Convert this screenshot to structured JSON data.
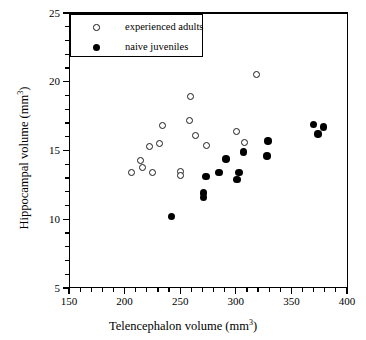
{
  "chart_data": {
    "type": "scatter",
    "title": "",
    "xlabel": "Telencephalon volume (mm3)",
    "ylabel": "Hippocampal volume (mm3)",
    "xlabel_text": "Telencephalon volume (mm",
    "xlabel_sup": "3",
    "xlabel_tail": ")",
    "ylabel_text": "Hippocampal volume (mm",
    "ylabel_sup": "3",
    "ylabel_tail": ")",
    "xlim": [
      150,
      400
    ],
    "ylim": [
      5,
      25
    ],
    "xticks": [
      150,
      200,
      250,
      300,
      350,
      400
    ],
    "xtick_labels": [
      "150",
      "200",
      "250",
      "300",
      "350",
      "400"
    ],
    "yticks": [
      5,
      10,
      15,
      20,
      25
    ],
    "ytick_labels": [
      "5",
      "10",
      "15",
      "20",
      "25"
    ],
    "x_minor_interval": 10,
    "y_minor_interval": 1,
    "grid": false,
    "legend_position": "top-left",
    "series": [
      {
        "name": "experienced adults",
        "marker": "open-circle",
        "color": "#ffffff",
        "edge_color": "#1a1a1a",
        "points": [
          {
            "x": 206,
            "y": 13.4
          },
          {
            "x": 214,
            "y": 14.3
          },
          {
            "x": 216,
            "y": 13.8
          },
          {
            "x": 222,
            "y": 15.3
          },
          {
            "x": 225,
            "y": 13.4
          },
          {
            "x": 231,
            "y": 15.5
          },
          {
            "x": 234,
            "y": 16.8
          },
          {
            "x": 250,
            "y": 13.5
          },
          {
            "x": 250,
            "y": 13.2
          },
          {
            "x": 258,
            "y": 17.2
          },
          {
            "x": 259,
            "y": 18.9
          },
          {
            "x": 264,
            "y": 16.1
          },
          {
            "x": 274,
            "y": 15.4
          },
          {
            "x": 301,
            "y": 16.4
          },
          {
            "x": 308,
            "y": 15.6
          },
          {
            "x": 319,
            "y": 20.5
          }
        ]
      },
      {
        "name": "naive juveniles",
        "marker": "filled-circle",
        "color": "#000000",
        "edge_color": "#000000",
        "points": [
          {
            "x": 242,
            "y": 10.2
          },
          {
            "x": 271,
            "y": 11.6
          },
          {
            "x": 271,
            "y": 11.9
          },
          {
            "x": 273,
            "y": 13.1
          },
          {
            "x": 285,
            "y": 13.4
          },
          {
            "x": 291,
            "y": 14.4
          },
          {
            "x": 301,
            "y": 12.9
          },
          {
            "x": 303,
            "y": 13.4
          },
          {
            "x": 307,
            "y": 14.9
          },
          {
            "x": 328,
            "y": 14.6
          },
          {
            "x": 329,
            "y": 15.7
          },
          {
            "x": 370,
            "y": 16.9
          },
          {
            "x": 374,
            "y": 16.2
          },
          {
            "x": 379,
            "y": 16.7
          }
        ]
      }
    ]
  },
  "legend": {
    "entries": [
      {
        "label": "experienced adults",
        "marker": "open-circle"
      },
      {
        "label": "naive juveniles",
        "marker": "filled-circle"
      }
    ]
  },
  "top_clipped_caption": ""
}
